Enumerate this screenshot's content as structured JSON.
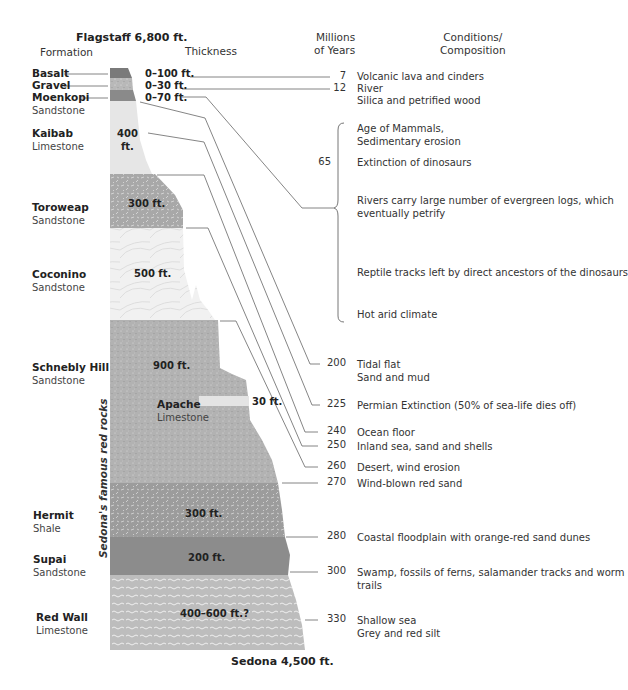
{
  "header": {
    "top_location": "Flagstaff 6,800 ft.",
    "bottom_location": "Sedona 4,500 ft.",
    "col_formation": "Formation",
    "col_thickness": "Thickness",
    "col_mya_line1": "Millions",
    "col_mya_line2": "of Years",
    "col_cond_line1": "Conditions/",
    "col_cond_line2": "Composition"
  },
  "side_label": "Sedona's famous red rocks",
  "formations": [
    {
      "name": "Basalt",
      "type": "",
      "thickness": "0–100 ft."
    },
    {
      "name": "Gravel",
      "type": "",
      "thickness": "0–30 ft."
    },
    {
      "name": "Moenkopi",
      "type": "Sandstone",
      "thickness": "0–70 ft."
    },
    {
      "name": "Kaibab",
      "type": "Limestone",
      "thickness_line1": "400",
      "thickness_line2": "ft."
    },
    {
      "name": "Toroweap",
      "type": "Sandstone",
      "thickness": "300 ft."
    },
    {
      "name": "Coconino",
      "type": "Sandstone",
      "thickness": "500 ft."
    },
    {
      "name": "Schnebly Hill",
      "type": "Sandstone",
      "thickness": "900 ft."
    },
    {
      "name": "Apache",
      "type": "Limestone",
      "thickness": "30 ft."
    },
    {
      "name": "Hermit",
      "type": "Shale",
      "thickness": "300 ft."
    },
    {
      "name": "Supai",
      "type": "Sandstone",
      "thickness": "200 ft."
    },
    {
      "name": "Red Wall",
      "type": "Limestone",
      "thickness": "400–600 ft.?"
    }
  ],
  "timeline": [
    {
      "mya": "7",
      "lines": [
        "Volcanic lava and cinders"
      ]
    },
    {
      "mya": "12",
      "lines": [
        "River",
        "Silica and petrified wood"
      ]
    },
    {
      "mya": "",
      "lines": [
        "Age of Mammals,",
        "Sedimentary erosion"
      ]
    },
    {
      "mya": "65",
      "lines": [
        "Extinction of dinosaurs"
      ]
    },
    {
      "mya": "",
      "lines": [
        "Rivers carry large number of evergreen logs, which",
        "eventually petrify"
      ]
    },
    {
      "mya": "",
      "lines": [
        "Reptile tracks left by direct ancestors of the dinosaurs"
      ]
    },
    {
      "mya": "",
      "lines": [
        "Hot arid climate"
      ]
    },
    {
      "mya": "200",
      "lines": [
        "Tidal flat",
        "Sand and mud"
      ]
    },
    {
      "mya": "225",
      "lines": [
        "Permian Extinction (50% of sea-life dies off)"
      ]
    },
    {
      "mya": "240",
      "lines": [
        "Ocean floor"
      ]
    },
    {
      "mya": "250",
      "lines": [
        "Inland sea, sand and shells"
      ]
    },
    {
      "mya": "260",
      "lines": [
        "Desert, wind erosion"
      ]
    },
    {
      "mya": "270",
      "lines": [
        "Wind-blown red sand"
      ]
    },
    {
      "mya": "280",
      "lines": [
        "Coastal floodplain with orange-red sand dunes"
      ]
    },
    {
      "mya": "300",
      "lines": [
        "Swamp, fossils of ferns, salamander tracks and worm",
        "trails"
      ]
    },
    {
      "mya": "330",
      "lines": [
        "Shallow sea",
        "Grey and red silt"
      ]
    }
  ],
  "colors": {
    "basalt": "#7a7a7a",
    "gravel": "#b4b4b4",
    "moenkopi": "#8a8a8a",
    "kaibab": "#e6e6e6",
    "toroweap": "#a8a8a8",
    "coconino": "#f0f0f0",
    "schnebly": "#b2b2b2",
    "apache": "#e2e2e2",
    "hermit": "#9c9c9c",
    "supai": "#8c8c8c",
    "redwall": "#bdbdbd",
    "leader": "#666666"
  }
}
